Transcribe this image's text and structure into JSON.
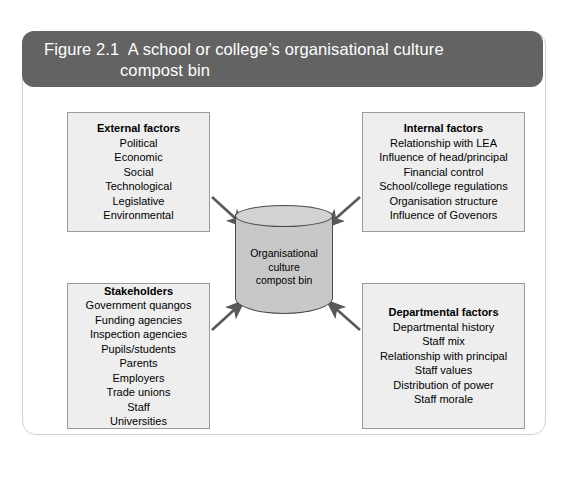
{
  "figure": {
    "title_line_1": "Figure 2.1  A school or college’s organisational culture",
    "title_line_2": "compost bin"
  },
  "center": {
    "label_line_1": "Organisational",
    "label_line_2": "culture",
    "label_line_3": "compost bin"
  },
  "boxes": [
    {
      "id": "external",
      "title": "External factors",
      "items": [
        "Political",
        "Economic",
        "Social",
        "Technological",
        "Legislative",
        "Environmental"
      ]
    },
    {
      "id": "internal",
      "title": "Internal factors",
      "items": [
        "Relationship with LEA",
        "Influence of head/principal",
        "Financial control",
        "School/college regulations",
        "Organisation structure",
        "Influence of Govenors"
      ]
    },
    {
      "id": "stakeholders",
      "title": "Stakeholders",
      "items": [
        "Government quangos",
        "Funding agencies",
        "Inspection agencies",
        "Pupils/students",
        "Parents",
        "Employers",
        "Trade unions",
        "Staff",
        "Universities"
      ]
    },
    {
      "id": "departmental",
      "title": "Departmental factors",
      "items": [
        "Departmental history",
        "Staff mix",
        "Relationship with principal",
        "Staff values",
        "Distribution of power",
        "Staff morale"
      ]
    }
  ],
  "colors": {
    "title_bar": "#636363",
    "box_fill": "#eeeeee",
    "box_border": "#9a9a9a",
    "cylinder_fill": "#c8c8c8",
    "cylinder_top": "#d2d2d2",
    "cylinder_border": "#4a4a4a",
    "arrow": "#595959",
    "frame_border": "#cfcfcf",
    "text": "#000000"
  }
}
